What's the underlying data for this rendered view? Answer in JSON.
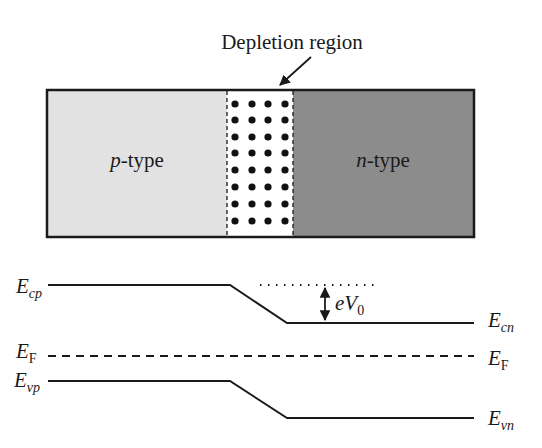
{
  "junction": {
    "depletion_label": "Depletion region",
    "p_region": {
      "label_italic": "p",
      "label_rest": "-type",
      "color": "#e2e2e2"
    },
    "n_region": {
      "label_italic": "n",
      "label_rest": "-type",
      "color": "#8c8c8c"
    },
    "depletion_color": "#ffffff",
    "border_color": "#1a1a1a",
    "dot_color": "#111111"
  },
  "band_diagram": {
    "left_labels": {
      "ecp": {
        "main": "E",
        "sub": "cp"
      },
      "ef": {
        "main": "E",
        "sub": "F"
      },
      "evp": {
        "main": "E",
        "sub": "vp"
      }
    },
    "right_labels": {
      "ecn": {
        "main": "E",
        "sub": "cn"
      },
      "ef": {
        "main": "E",
        "sub": "F"
      },
      "evn": {
        "main": "E",
        "sub": "vn"
      }
    },
    "barrier_label": {
      "prefix": "eV",
      "sub": "0"
    }
  }
}
